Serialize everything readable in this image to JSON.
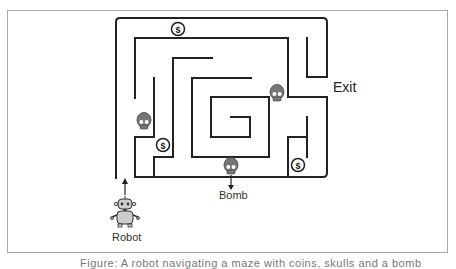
{
  "figure": {
    "labels": {
      "exit": "Exit",
      "bomb": "Bomb",
      "robot": "Robot"
    },
    "caption": "Figure: A robot navigating a maze with coins, skulls and a bomb"
  },
  "icons": {
    "coins": [
      {
        "name": "coin-icon",
        "symbol": "$",
        "x": 178,
        "y": 29
      },
      {
        "name": "coin-icon",
        "symbol": "$",
        "x": 163,
        "y": 145
      },
      {
        "name": "coin-icon",
        "symbol": "$",
        "x": 298,
        "y": 165
      }
    ],
    "skulls": [
      {
        "name": "skull-icon",
        "x": 144,
        "y": 122
      },
      {
        "name": "skull-icon",
        "x": 277,
        "y": 94
      },
      {
        "name": "skull-icon",
        "x": 231,
        "y": 167
      }
    ],
    "robot": {
      "name": "robot-icon",
      "x": 125,
      "y": 210
    }
  },
  "colors": {
    "wall": "#222222",
    "frame": "#a8a8a8",
    "icon_fill": "#777777",
    "coin_fill": "#ffffff"
  }
}
